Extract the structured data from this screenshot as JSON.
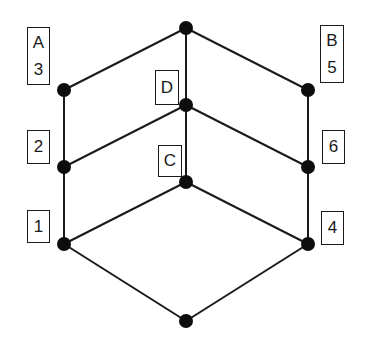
{
  "diagram": {
    "type": "lattice",
    "colors": {
      "line": "#1a1a1a",
      "node": "#0d0d0d",
      "background": "#ffffff"
    },
    "nodes": [
      {
        "id": "top",
        "x": 186,
        "y": 28
      },
      {
        "id": "A3",
        "x": 64,
        "y": 90
      },
      {
        "id": "D",
        "x": 186,
        "y": 105
      },
      {
        "id": "B5",
        "x": 308,
        "y": 90
      },
      {
        "id": "n2",
        "x": 64,
        "y": 167
      },
      {
        "id": "C",
        "x": 186,
        "y": 182
      },
      {
        "id": "n6",
        "x": 308,
        "y": 167
      },
      {
        "id": "n1",
        "x": 64,
        "y": 244
      },
      {
        "id": "n4",
        "x": 308,
        "y": 244
      },
      {
        "id": "bottom",
        "x": 186,
        "y": 321
      }
    ],
    "edges": [
      [
        "top",
        "A3"
      ],
      [
        "top",
        "B5"
      ],
      [
        "top",
        "D"
      ],
      [
        "A3",
        "n2"
      ],
      [
        "D",
        "n2"
      ],
      [
        "D",
        "n6"
      ],
      [
        "D",
        "C"
      ],
      [
        "B5",
        "n6"
      ],
      [
        "n2",
        "n1"
      ],
      [
        "C",
        "n1"
      ],
      [
        "C",
        "n4"
      ],
      [
        "n6",
        "n4"
      ],
      [
        "n1",
        "bottom"
      ],
      [
        "n4",
        "bottom"
      ]
    ],
    "labels": [
      {
        "id": "label-A3",
        "lines": [
          "A",
          "3"
        ],
        "x": 27,
        "y": 27,
        "w": 23,
        "h": 58
      },
      {
        "id": "label-B5",
        "lines": [
          "B",
          "5"
        ],
        "x": 320,
        "y": 25,
        "w": 24,
        "h": 58
      },
      {
        "id": "label-2",
        "lines": [
          "2"
        ],
        "x": 27,
        "y": 130,
        "w": 23,
        "h": 34
      },
      {
        "id": "label-6",
        "lines": [
          "6"
        ],
        "x": 322,
        "y": 130,
        "w": 23,
        "h": 34
      },
      {
        "id": "label-1",
        "lines": [
          "1"
        ],
        "x": 27,
        "y": 210,
        "w": 23,
        "h": 33
      },
      {
        "id": "label-4",
        "lines": [
          "4"
        ],
        "x": 321,
        "y": 211,
        "w": 23,
        "h": 34
      },
      {
        "id": "label-D",
        "lines": [
          "D"
        ],
        "x": 155,
        "y": 70,
        "w": 24,
        "h": 35
      },
      {
        "id": "label-C",
        "lines": [
          "C"
        ],
        "x": 158,
        "y": 145,
        "w": 24,
        "h": 32
      }
    ]
  }
}
